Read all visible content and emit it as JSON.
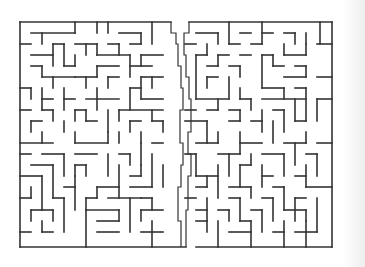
{
  "maze": {
    "bounds": {
      "x": 20,
      "y": 22,
      "w": 312,
      "h": 225
    },
    "wall_color": "#333333",
    "background": "#ffffff",
    "outer": [
      [
        20,
        22,
        171,
        22
      ],
      [
        189,
        22,
        332,
        22
      ],
      [
        332,
        22,
        332,
        247
      ],
      [
        332,
        247,
        196,
        247
      ],
      [
        186,
        247,
        20,
        247
      ],
      [
        20,
        22,
        20,
        247
      ]
    ],
    "walls": [
      [
        31,
        33,
        75,
        33
      ],
      [
        42,
        33,
        42,
        44
      ],
      [
        75,
        22,
        75,
        33
      ],
      [
        97,
        22,
        97,
        33
      ],
      [
        108,
        22,
        108,
        33
      ],
      [
        119,
        33,
        141,
        33
      ],
      [
        141,
        33,
        141,
        44
      ],
      [
        152,
        22,
        152,
        44
      ],
      [
        20,
        44,
        31,
        44
      ],
      [
        53,
        44,
        64,
        44
      ],
      [
        53,
        44,
        53,
        66
      ],
      [
        64,
        44,
        64,
        66
      ],
      [
        75,
        44,
        97,
        44
      ],
      [
        86,
        44,
        86,
        55
      ],
      [
        97,
        44,
        97,
        55
      ],
      [
        108,
        44,
        119,
        44
      ],
      [
        119,
        44,
        119,
        55
      ],
      [
        130,
        44,
        141,
        44
      ],
      [
        31,
        55,
        53,
        55
      ],
      [
        75,
        55,
        75,
        66
      ],
      [
        97,
        55,
        130,
        55
      ],
      [
        130,
        55,
        130,
        77
      ],
      [
        141,
        55,
        163,
        55
      ],
      [
        141,
        55,
        141,
        66
      ],
      [
        31,
        66,
        42,
        66
      ],
      [
        42,
        66,
        42,
        77
      ],
      [
        64,
        66,
        75,
        66
      ],
      [
        97,
        66,
        97,
        77
      ],
      [
        97,
        66,
        119,
        66
      ],
      [
        130,
        66,
        152,
        66
      ],
      [
        42,
        77,
        75,
        77
      ],
      [
        53,
        77,
        53,
        88
      ],
      [
        75,
        77,
        97,
        77
      ],
      [
        86,
        77,
        86,
        88
      ],
      [
        108,
        77,
        108,
        88
      ],
      [
        108,
        77,
        119,
        77
      ],
      [
        141,
        77,
        163,
        77
      ],
      [
        141,
        77,
        141,
        99
      ],
      [
        152,
        77,
        152,
        88
      ],
      [
        20,
        88,
        31,
        88
      ],
      [
        31,
        88,
        31,
        99
      ],
      [
        42,
        88,
        42,
        110
      ],
      [
        42,
        99,
        53,
        99
      ],
      [
        64,
        88,
        64,
        110
      ],
      [
        64,
        99,
        75,
        99
      ],
      [
        86,
        99,
        119,
        99
      ],
      [
        97,
        88,
        97,
        110
      ],
      [
        130,
        88,
        130,
        110
      ],
      [
        130,
        88,
        141,
        88
      ],
      [
        141,
        99,
        163,
        99
      ],
      [
        20,
        110,
        31,
        110
      ],
      [
        42,
        110,
        53,
        110
      ],
      [
        53,
        110,
        53,
        121
      ],
      [
        75,
        110,
        75,
        121
      ],
      [
        75,
        110,
        86,
        110
      ],
      [
        86,
        110,
        86,
        121
      ],
      [
        108,
        110,
        108,
        132
      ],
      [
        119,
        110,
        119,
        121
      ],
      [
        119,
        110,
        163,
        110
      ],
      [
        152,
        110,
        152,
        121
      ],
      [
        31,
        121,
        31,
        132
      ],
      [
        31,
        121,
        42,
        121
      ],
      [
        64,
        121,
        64,
        132
      ],
      [
        86,
        121,
        97,
        121
      ],
      [
        130,
        121,
        130,
        132
      ],
      [
        130,
        121,
        141,
        121
      ],
      [
        152,
        121,
        163,
        121
      ],
      [
        163,
        121,
        163,
        132
      ],
      [
        20,
        143,
        53,
        143
      ],
      [
        42,
        132,
        42,
        143
      ],
      [
        75,
        143,
        108,
        143
      ],
      [
        75,
        132,
        75,
        143
      ],
      [
        108,
        132,
        108,
        143
      ],
      [
        119,
        132,
        119,
        143
      ],
      [
        141,
        132,
        141,
        143
      ],
      [
        152,
        143,
        163,
        143
      ],
      [
        20,
        154,
        31,
        154
      ],
      [
        42,
        154,
        64,
        154
      ],
      [
        64,
        154,
        64,
        176
      ],
      [
        75,
        154,
        97,
        154
      ],
      [
        108,
        154,
        108,
        176
      ],
      [
        119,
        154,
        130,
        154
      ],
      [
        130,
        154,
        130,
        165
      ],
      [
        141,
        143,
        141,
        165
      ],
      [
        152,
        154,
        152,
        187
      ],
      [
        31,
        165,
        53,
        165
      ],
      [
        53,
        165,
        53,
        198
      ],
      [
        75,
        165,
        75,
        176
      ],
      [
        75,
        165,
        86,
        165
      ],
      [
        86,
        165,
        86,
        176
      ],
      [
        119,
        165,
        119,
        198
      ],
      [
        130,
        176,
        141,
        176
      ],
      [
        141,
        165,
        141,
        176
      ],
      [
        20,
        176,
        42,
        176
      ],
      [
        42,
        176,
        42,
        210
      ],
      [
        64,
        187,
        75,
        187
      ],
      [
        75,
        176,
        75,
        210
      ],
      [
        97,
        187,
        97,
        198
      ],
      [
        97,
        187,
        119,
        187
      ],
      [
        130,
        187,
        152,
        187
      ],
      [
        163,
        165,
        163,
        187
      ],
      [
        20,
        198,
        31,
        198
      ],
      [
        31,
        187,
        31,
        198
      ],
      [
        53,
        198,
        64,
        198
      ],
      [
        64,
        198,
        64,
        232
      ],
      [
        86,
        198,
        86,
        210
      ],
      [
        86,
        198,
        97,
        198
      ],
      [
        108,
        198,
        141,
        198
      ],
      [
        130,
        198,
        130,
        232
      ],
      [
        141,
        198,
        152,
        198
      ],
      [
        152,
        198,
        152,
        210
      ],
      [
        31,
        210,
        53,
        210
      ],
      [
        31,
        210,
        31,
        221
      ],
      [
        53,
        210,
        53,
        221
      ],
      [
        86,
        210,
        86,
        247
      ],
      [
        86,
        210,
        119,
        210
      ],
      [
        97,
        221,
        119,
        221
      ],
      [
        119,
        210,
        119,
        221
      ],
      [
        141,
        210,
        163,
        210
      ],
      [
        141,
        210,
        141,
        221
      ],
      [
        20,
        232,
        31,
        232
      ],
      [
        42,
        221,
        42,
        232
      ],
      [
        42,
        232,
        53,
        232
      ],
      [
        97,
        232,
        119,
        232
      ],
      [
        141,
        232,
        163,
        232
      ],
      [
        152,
        221,
        152,
        247
      ],
      [
        196,
        33,
        218,
        33
      ],
      [
        218,
        33,
        218,
        44
      ],
      [
        229,
        22,
        229,
        44
      ],
      [
        240,
        33,
        251,
        33
      ],
      [
        262,
        33,
        273,
        33
      ],
      [
        262,
        22,
        262,
        44
      ],
      [
        284,
        33,
        295,
        33
      ],
      [
        295,
        33,
        295,
        44
      ],
      [
        306,
        33,
        306,
        44
      ],
      [
        320,
        22,
        320,
        44
      ],
      [
        185,
        44,
        196,
        44
      ],
      [
        207,
        44,
        207,
        55
      ],
      [
        229,
        44,
        240,
        44
      ],
      [
        251,
        44,
        262,
        44
      ],
      [
        284,
        44,
        284,
        55
      ],
      [
        284,
        55,
        306,
        55
      ],
      [
        306,
        44,
        306,
        55
      ],
      [
        317,
        44,
        332,
        44
      ],
      [
        196,
        55,
        196,
        99
      ],
      [
        196,
        55,
        207,
        55
      ],
      [
        218,
        55,
        229,
        55
      ],
      [
        218,
        55,
        218,
        66
      ],
      [
        240,
        55,
        251,
        55
      ],
      [
        262,
        55,
        262,
        88
      ],
      [
        262,
        55,
        273,
        55
      ],
      [
        273,
        66,
        284,
        66
      ],
      [
        273,
        55,
        273,
        66
      ],
      [
        207,
        66,
        218,
        66
      ],
      [
        229,
        66,
        240,
        66
      ],
      [
        240,
        66,
        240,
        77
      ],
      [
        284,
        77,
        306,
        77
      ],
      [
        295,
        66,
        306,
        66
      ],
      [
        306,
        66,
        306,
        77
      ],
      [
        317,
        77,
        332,
        77
      ],
      [
        207,
        77,
        218,
        77
      ],
      [
        207,
        77,
        207,
        88
      ],
      [
        229,
        77,
        229,
        99
      ],
      [
        240,
        88,
        240,
        99
      ],
      [
        262,
        88,
        284,
        88
      ],
      [
        284,
        88,
        284,
        99
      ],
      [
        295,
        88,
        306,
        88
      ],
      [
        306,
        88,
        306,
        121
      ],
      [
        196,
        99,
        229,
        99
      ],
      [
        218,
        99,
        218,
        110
      ],
      [
        240,
        99,
        251,
        99
      ],
      [
        251,
        99,
        251,
        110
      ],
      [
        262,
        99,
        306,
        99
      ],
      [
        295,
        99,
        295,
        121
      ],
      [
        317,
        99,
        332,
        99
      ],
      [
        317,
        99,
        317,
        121
      ],
      [
        185,
        110,
        196,
        110
      ],
      [
        207,
        110,
        218,
        110
      ],
      [
        229,
        110,
        240,
        110
      ],
      [
        240,
        110,
        240,
        121
      ],
      [
        262,
        110,
        262,
        132
      ],
      [
        273,
        110,
        284,
        110
      ],
      [
        284,
        110,
        284,
        132
      ],
      [
        185,
        121,
        207,
        121
      ],
      [
        207,
        121,
        207,
        143
      ],
      [
        229,
        121,
        240,
        121
      ],
      [
        251,
        121,
        262,
        121
      ],
      [
        273,
        121,
        273,
        143
      ],
      [
        295,
        121,
        306,
        121
      ],
      [
        196,
        143,
        218,
        143
      ],
      [
        218,
        132,
        218,
        143
      ],
      [
        240,
        143,
        262,
        143
      ],
      [
        240,
        132,
        240,
        154
      ],
      [
        284,
        143,
        306,
        143
      ],
      [
        295,
        143,
        295,
        165
      ],
      [
        306,
        132,
        306,
        143
      ],
      [
        317,
        143,
        332,
        143
      ],
      [
        185,
        154,
        196,
        154
      ],
      [
        196,
        154,
        196,
        176
      ],
      [
        218,
        154,
        240,
        154
      ],
      [
        229,
        154,
        229,
        176
      ],
      [
        251,
        154,
        251,
        165
      ],
      [
        262,
        154,
        284,
        154
      ],
      [
        284,
        154,
        284,
        176
      ],
      [
        306,
        154,
        317,
        154
      ],
      [
        317,
        154,
        317,
        176
      ],
      [
        196,
        176,
        218,
        176
      ],
      [
        207,
        176,
        207,
        187
      ],
      [
        218,
        165,
        218,
        198
      ],
      [
        240,
        165,
        251,
        165
      ],
      [
        240,
        165,
        240,
        187
      ],
      [
        262,
        165,
        262,
        187
      ],
      [
        262,
        176,
        273,
        176
      ],
      [
        295,
        176,
        306,
        176
      ],
      [
        306,
        165,
        306,
        187
      ],
      [
        196,
        187,
        207,
        187
      ],
      [
        229,
        187,
        251,
        187
      ],
      [
        251,
        187,
        251,
        198
      ],
      [
        273,
        187,
        284,
        187
      ],
      [
        284,
        187,
        284,
        210
      ],
      [
        295,
        198,
        306,
        198
      ],
      [
        306,
        187,
        332,
        187
      ],
      [
        185,
        198,
        196,
        198
      ],
      [
        207,
        198,
        207,
        232
      ],
      [
        229,
        198,
        240,
        198
      ],
      [
        240,
        198,
        240,
        221
      ],
      [
        262,
        198,
        273,
        198
      ],
      [
        273,
        198,
        273,
        221
      ],
      [
        295,
        198,
        295,
        221
      ],
      [
        317,
        198,
        317,
        232
      ],
      [
        196,
        210,
        207,
        210
      ],
      [
        218,
        210,
        229,
        210
      ],
      [
        229,
        210,
        229,
        221
      ],
      [
        251,
        210,
        262,
        210
      ],
      [
        262,
        210,
        262,
        232
      ],
      [
        284,
        210,
        306,
        210
      ],
      [
        306,
        210,
        306,
        221
      ],
      [
        196,
        221,
        207,
        221
      ],
      [
        218,
        221,
        218,
        247
      ],
      [
        229,
        232,
        251,
        232
      ],
      [
        240,
        221,
        251,
        221
      ],
      [
        251,
        221,
        251,
        247
      ],
      [
        273,
        232,
        284,
        232
      ],
      [
        284,
        221,
        284,
        247
      ],
      [
        295,
        232,
        317,
        232
      ],
      [
        306,
        221,
        306,
        247
      ]
    ],
    "solution_path": [
      [
        171,
        22
      ],
      [
        171,
        33
      ],
      [
        176,
        33
      ],
      [
        176,
        44
      ],
      [
        178,
        44
      ],
      [
        178,
        66
      ],
      [
        181,
        66
      ],
      [
        181,
        88
      ],
      [
        183,
        88
      ],
      [
        183,
        110
      ],
      [
        180,
        110
      ],
      [
        180,
        143
      ],
      [
        183,
        143
      ],
      [
        183,
        165
      ],
      [
        181,
        165
      ],
      [
        181,
        187
      ],
      [
        178,
        187
      ],
      [
        178,
        221
      ],
      [
        181,
        221
      ],
      [
        181,
        247
      ]
    ],
    "solution_path_alt": [
      [
        189,
        22
      ],
      [
        189,
        33
      ],
      [
        184,
        33
      ],
      [
        184,
        55
      ],
      [
        186,
        55
      ],
      [
        186,
        77
      ],
      [
        189,
        77
      ],
      [
        189,
        99
      ],
      [
        191,
        99
      ],
      [
        191,
        132
      ],
      [
        188,
        132
      ],
      [
        188,
        154
      ],
      [
        191,
        154
      ],
      [
        191,
        176
      ],
      [
        188,
        176
      ],
      [
        188,
        210
      ],
      [
        186,
        210
      ],
      [
        186,
        247
      ]
    ]
  }
}
